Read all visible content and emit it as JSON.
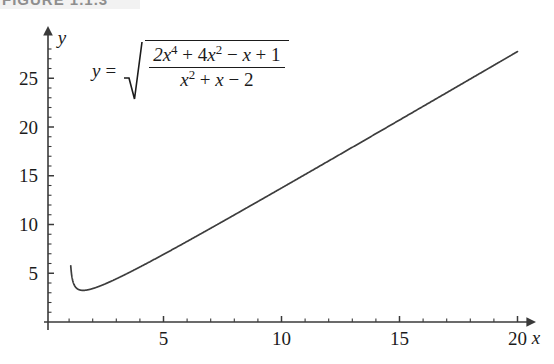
{
  "caption": {
    "text": "FIGURE 1.1.3",
    "band_color": "#f2f2f2"
  },
  "equation": {
    "lhs": "y",
    "eq_sign": "=",
    "radical_glyph": "square-root",
    "numerator_parts": [
      "2x",
      "4",
      " + 4x",
      "2",
      " − x + 1"
    ],
    "numerator_plain": "2x⁴ + 4x² − x + 1",
    "denominator_plain": "x² + x − 2",
    "full_plain": "y = √((2x⁴ + 4x² − x + 1) / (x² + x − 2))"
  },
  "axes": {
    "x_name": "x",
    "y_name": "y",
    "x_ticks": [
      "5",
      "10",
      "15",
      "20"
    ],
    "y_ticks": [
      "5",
      "10",
      "15",
      "20",
      "25"
    ],
    "axis_color": "#3a3a3a",
    "curve_color": "#3d3d3d"
  },
  "chart_data": {
    "type": "line",
    "title": "",
    "xlabel": "x",
    "ylabel": "y",
    "xlim": [
      0,
      20.8
    ],
    "ylim": [
      0,
      29
    ],
    "grid": false,
    "legend": null,
    "x_ticks": [
      5,
      10,
      15,
      20
    ],
    "y_ticks": [
      5,
      10,
      15,
      20,
      25
    ],
    "x_minor_tick_step": 1,
    "y_minor_tick_step": 1,
    "function": "y = sqrt((2x^4 + 4x^2 - x + 1)/(x^2 + x - 2))",
    "domain_note": "x > 1 (vertical asymptote at x = 1)",
    "asymptote_x": 1,
    "minimum": {
      "x": 1.6,
      "y": 3.4
    },
    "series": [
      {
        "name": "y",
        "x": [
          1.07,
          1.09,
          1.12,
          1.15,
          1.2,
          1.25,
          1.3,
          1.35,
          1.4,
          1.5,
          1.6,
          1.7,
          1.8,
          2.0,
          2.25,
          2.5,
          3.0,
          3.5,
          4.0,
          5.0,
          6.0,
          7.0,
          8.0,
          9.0,
          10.0,
          11.0,
          12.0,
          13.0,
          14.0,
          15.0,
          16.0,
          17.0,
          18.0,
          19.0,
          20.0
        ],
        "values": [
          11.6,
          10.3,
          9.1,
          8.1,
          7.0,
          6.1,
          5.5,
          5.0,
          4.6,
          4.1,
          3.8,
          3.6,
          3.5,
          3.5,
          3.6,
          3.8,
          4.4,
          5.0,
          5.8,
          7.2,
          8.7,
          10.2,
          11.7,
          13.2,
          14.7,
          16.2,
          17.7,
          19.2,
          20.7,
          22.2,
          23.7,
          25.2,
          26.7,
          28.2,
          29.7
        ]
      }
    ]
  }
}
